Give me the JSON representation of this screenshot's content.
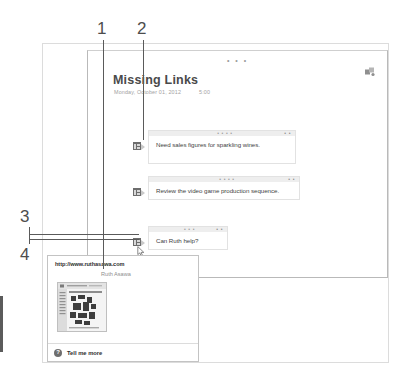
{
  "document": {
    "title": "Missing Links",
    "date": "Monday, October 01, 2012",
    "time": "5:00",
    "pane_dots": "• • •",
    "share_icon": "share-icon"
  },
  "messages": [
    {
      "icon": "contact-badge-icon",
      "text": "Need sales figures for sparkling wines.",
      "bar_dots": "• • • •",
      "bar_right": "• •"
    },
    {
      "icon": "contact-badge-icon",
      "text": "Review the video game production sequence.",
      "bar_dots": "• • • •",
      "bar_right": "• •"
    },
    {
      "icon": "contact-badge-icon",
      "text": "Can Ruth help?",
      "bar_dots": "• • •",
      "bar_right": "• •"
    }
  ],
  "popup": {
    "url": "http://www.ruthasawa.com",
    "name": "Ruth Asawa",
    "thumbnail_icon": "webpage-thumbnail",
    "footer_icon": "help-question-icon",
    "footer_label": "Tell me more"
  },
  "callouts": [
    {
      "number": "1"
    },
    {
      "number": "2"
    },
    {
      "number": "3"
    },
    {
      "number": "4"
    }
  ],
  "colors": {
    "outer_frame": "#dcdcdc",
    "inner_frame": "#b9b9b9",
    "bubble_border": "#e2e2e2",
    "bubble_bar": "#eeeeee",
    "badge": "#6d6d6d",
    "text": "#3f3f3f",
    "muted": "#a2a2a2",
    "leader": "#5a5a5a"
  }
}
